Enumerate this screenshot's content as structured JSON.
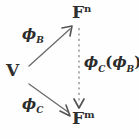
{
  "figure": {
    "type": "commutative-diagram",
    "background_color": "#fefefe",
    "stroke_color": "#5a5a5a",
    "text_color": "#2e2e2e"
  },
  "nodes": [
    {
      "id": "v",
      "name": "domain-vector-space",
      "base": "V",
      "superscript": "",
      "x": 6,
      "y": 62
    },
    {
      "id": "fn",
      "name": "codomain-f-n",
      "base": "F",
      "superscript": "n",
      "x": 72,
      "y": 4
    },
    {
      "id": "fm",
      "name": "codomain-f-m",
      "base": "F",
      "superscript": "m",
      "x": 72,
      "y": 110
    }
  ],
  "edges": [
    {
      "id": "phi-b",
      "name": "coordinate-map-b",
      "style": "solid",
      "phi": "ϕ",
      "subscript": "B",
      "from": "v",
      "to": "fn"
    },
    {
      "id": "phi-c",
      "name": "coordinate-map-c",
      "style": "solid",
      "phi": "ϕ",
      "subscript": "C",
      "from": "v",
      "to": "fm"
    },
    {
      "id": "transition",
      "name": "transition-map",
      "style": "dashed",
      "phi": "ϕ",
      "subscript": "C",
      "open_paren": "(",
      "phi2": "ϕ",
      "subscript2": "B",
      "close_paren": ")",
      "superscript": "-1",
      "from": "fn",
      "to": "fm"
    }
  ]
}
